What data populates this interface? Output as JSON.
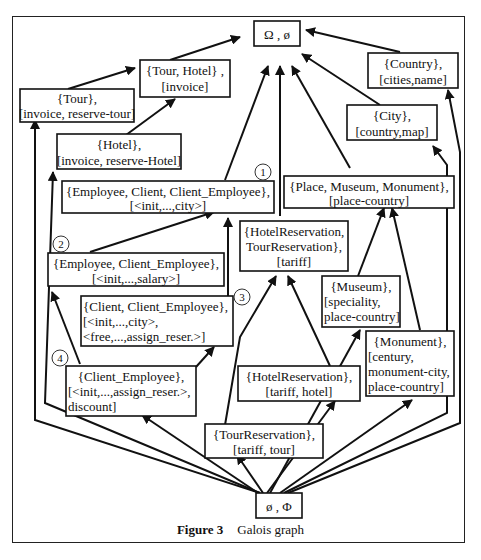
{
  "figure": {
    "label": "Figure 3",
    "title": "Galois graph"
  },
  "nodes": {
    "top": {
      "line1": "Ω , ø"
    },
    "bottom": {
      "line1": "ø , Φ"
    },
    "tour_hotel": {
      "line1": "{Tour, Hotel} ,",
      "line2": "[invoice]"
    },
    "tour": {
      "line1": "{Tour},",
      "line2": "[invoice, reserve-tour]"
    },
    "hotel": {
      "line1": "{Hotel},",
      "line2": "[invoice, reserve-Hotel]"
    },
    "country": {
      "line1": "{Country},",
      "line2": "[cities,name]"
    },
    "city": {
      "line1": "{City},",
      "line2": "[country,map]"
    },
    "emp_client": {
      "line1": "{Employee, Client, Client_Employee},",
      "line2": "[<init,...,city>]",
      "number": "1"
    },
    "place": {
      "line1": "{Place, Museum, Monument},",
      "line2": "[place-country]"
    },
    "hotelres_tourres": {
      "line1": "{HotelReservation,",
      "line2": "TourReservation},",
      "line3": "[tariff]"
    },
    "emp_clemp": {
      "line1": "{Employee, Client_Employee},",
      "line2": "[<init,...,salary>]",
      "number": "2"
    },
    "museum": {
      "line1": "{Museum},",
      "line2": "[speciality,",
      "line3": "place-country]"
    },
    "client_clemp": {
      "line1": "{Client, Client_Employee},",
      "line2": "[<init,...,city>,",
      "line3": "<free,...,assign_reser.>]",
      "number": "3"
    },
    "monument": {
      "line1": "{Monument},",
      "line2": "[century,",
      "line3": "monument-city,",
      "line4": "place-country]"
    },
    "client_employee": {
      "line1": "{Client_Employee},",
      "line2": "[<init,...,assign_reser.>,",
      "line3": "discount]",
      "number": "4"
    },
    "hotelres": {
      "line1": "{HotelReservation},",
      "line2": "[tariff, hotel]"
    },
    "tourres": {
      "line1": "{TourReservation},",
      "line2": "[tariff, tour]"
    }
  },
  "edges": [
    [
      "tour_hotel",
      "top"
    ],
    [
      "emp_client",
      "top"
    ],
    [
      "hotelres_tourres",
      "top"
    ],
    [
      "place",
      "top"
    ],
    [
      "city",
      "top"
    ],
    [
      "country",
      "top"
    ],
    [
      "tour",
      "tour_hotel"
    ],
    [
      "hotel",
      "tour_hotel"
    ],
    [
      "bottom",
      "tour"
    ],
    [
      "bottom",
      "hotel"
    ],
    [
      "emp_clemp",
      "emp_client"
    ],
    [
      "client_clemp",
      "emp_client"
    ],
    [
      "client_employee",
      "emp_clemp"
    ],
    [
      "client_employee",
      "client_clemp"
    ],
    [
      "tourres",
      "hotelres_tourres"
    ],
    [
      "hotelres",
      "hotelres_tourres"
    ],
    [
      "museum",
      "place"
    ],
    [
      "monument",
      "place"
    ],
    [
      "bottom",
      "city"
    ],
    [
      "bottom",
      "country"
    ],
    [
      "bottom",
      "museum"
    ],
    [
      "bottom",
      "monument"
    ],
    [
      "bottom",
      "client_employee"
    ],
    [
      "bottom",
      "tourres"
    ],
    [
      "bottom",
      "hotelres"
    ]
  ]
}
